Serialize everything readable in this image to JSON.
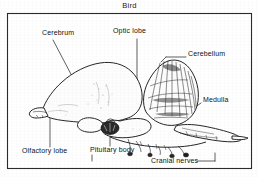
{
  "figure": {
    "title": "Bird",
    "caption_position": "top-center",
    "frame": {
      "visible": true,
      "color": "#2b2b2b"
    },
    "background_color": "#ffffff",
    "ink_color": "#1a1a1a",
    "labels": [
      {
        "id": "cerebrum",
        "text": "Cerebrum",
        "x": 42,
        "y": 33,
        "leader": "diagonal-down-right"
      },
      {
        "id": "optic-lobe",
        "text": "Optic lobe",
        "x": 113,
        "y": 31,
        "leader": "vertical-down"
      },
      {
        "id": "cerebellum",
        "text": "Cerebellum",
        "x": 188,
        "y": 54,
        "leader": "horizontal-left"
      },
      {
        "id": "medulla",
        "text": "Medulla",
        "x": 203,
        "y": 100,
        "leader": "diagonal-down-left"
      },
      {
        "id": "olfactory-lobe",
        "text": "Olfactory lobe",
        "x": 22,
        "y": 151,
        "leader": "vertical-up"
      },
      {
        "id": "pituitary-body",
        "text": "Pituitary body",
        "x": 90,
        "y": 150,
        "leader": "vertical-up"
      },
      {
        "id": "cranial-nerves",
        "text": "Cranial nerves",
        "x": 151,
        "y": 160,
        "leader": "horizontal-right"
      }
    ]
  }
}
